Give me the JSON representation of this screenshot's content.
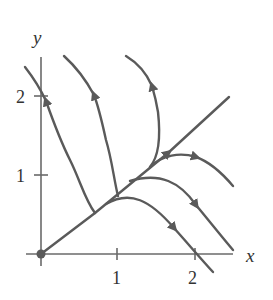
{
  "figure": {
    "type": "phase-portrait",
    "colors": {
      "curve": "#5a5a5a",
      "axis": "#6a6a6a",
      "text": "#333333",
      "background": "#ffffff"
    },
    "axes": {
      "x_label": "x",
      "y_label": "y",
      "x_ticks": [
        {
          "value": 1,
          "label": "1"
        },
        {
          "value": 2,
          "label": "2"
        }
      ],
      "y_ticks": [
        {
          "value": 1,
          "label": "1"
        },
        {
          "value": 2,
          "label": "2"
        }
      ]
    },
    "equilibrium": {
      "x": 0,
      "y": 0,
      "label": "origin (dot)"
    },
    "trajectories_count": 7
  }
}
